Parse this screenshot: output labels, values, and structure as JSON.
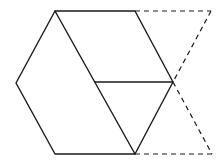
{
  "diagram": {
    "background": "#ffffff",
    "stroke_color": "#1a1a1a",
    "hexagon": {
      "vertices": [
        [
          55,
          11
        ],
        [
          135,
          11
        ],
        [
          173,
          82
        ],
        [
          135,
          154
        ],
        [
          55,
          154
        ],
        [
          16,
          83
        ]
      ]
    },
    "inner_lines": [
      {
        "from": [
          55,
          11
        ],
        "to": [
          135,
          154
        ]
      },
      {
        "from": [
          95,
          82
        ],
        "to": [
          173,
          82
        ]
      }
    ],
    "dashed_lines": [
      {
        "from": [
          135,
          11
        ],
        "to": [
          211,
          11
        ]
      },
      {
        "from": [
          211,
          11
        ],
        "to": [
          173,
          82
        ]
      },
      {
        "from": [
          173,
          82
        ],
        "to": [
          212,
          154
        ]
      },
      {
        "from": [
          135,
          154
        ],
        "to": [
          212,
          154
        ]
      }
    ]
  }
}
